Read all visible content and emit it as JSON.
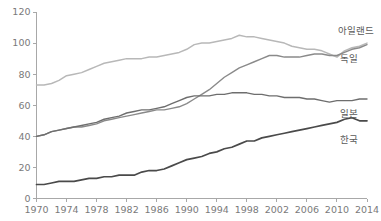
{
  "chart_data": {
    "type": "line",
    "title": "",
    "subtitle": "",
    "xlabel": "",
    "ylabel": "",
    "xlim": [
      1970,
      2014
    ],
    "ylim": [
      0,
      120
    ],
    "grid": false,
    "legend_position": "right-inline-labels",
    "x": [
      1970,
      1971,
      1972,
      1973,
      1974,
      1975,
      1976,
      1977,
      1978,
      1979,
      1980,
      1981,
      1982,
      1983,
      1984,
      1985,
      1986,
      1987,
      1988,
      1989,
      1990,
      1991,
      1992,
      1993,
      1994,
      1995,
      1996,
      1997,
      1998,
      1999,
      2000,
      2001,
      2002,
      2003,
      2004,
      2005,
      2006,
      2007,
      2008,
      2009,
      2010,
      2011,
      2012,
      2013,
      2014
    ],
    "xticks": [
      1970,
      1974,
      1978,
      1982,
      1986,
      1990,
      1994,
      1998,
      2002,
      2006,
      2010,
      2014
    ],
    "yticks": [
      0,
      20,
      40,
      60,
      80,
      100,
      120
    ],
    "series": [
      {
        "name": "아일랜드",
        "color": "#b8b8b8",
        "width": 1.5,
        "values": [
          73,
          73,
          74,
          76,
          79,
          80,
          81,
          83,
          85,
          87,
          88,
          89,
          90,
          90,
          90,
          91,
          91,
          92,
          93,
          94,
          96,
          99,
          100,
          100,
          101,
          102,
          103,
          105,
          104,
          104,
          103,
          102,
          101,
          100,
          98,
          97,
          96,
          96,
          95,
          93,
          91,
          95,
          97,
          98,
          100
        ]
      },
      {
        "name": "독일",
        "color": "#8a8a8a",
        "width": 1.4,
        "values": [
          40,
          41,
          43,
          44,
          45,
          46,
          46,
          47,
          48,
          50,
          51,
          52,
          53,
          54,
          55,
          56,
          57,
          57,
          58,
          59,
          61,
          64,
          67,
          70,
          74,
          78,
          81,
          84,
          86,
          88,
          90,
          92,
          92,
          91,
          91,
          91,
          92,
          93,
          93,
          92,
          92,
          94,
          96,
          97,
          99
        ]
      },
      {
        "name": "일본",
        "color": "#6e6e6e",
        "width": 1.4,
        "values": [
          40,
          41,
          43,
          44,
          45,
          46,
          47,
          48,
          49,
          51,
          52,
          53,
          55,
          56,
          57,
          57,
          58,
          59,
          61,
          63,
          65,
          66,
          66,
          66,
          67,
          67,
          68,
          68,
          68,
          67,
          67,
          66,
          66,
          65,
          65,
          65,
          64,
          64,
          63,
          62,
          63,
          63,
          63,
          64,
          64
        ]
      },
      {
        "name": "한국",
        "color": "#4a4a4a",
        "width": 1.7,
        "values": [
          9,
          9,
          10,
          11,
          11,
          11,
          12,
          13,
          13,
          14,
          14,
          15,
          15,
          15,
          17,
          18,
          18,
          19,
          21,
          23,
          25,
          26,
          27,
          29,
          30,
          32,
          33,
          35,
          37,
          37,
          39,
          40,
          41,
          42,
          43,
          44,
          45,
          46,
          47,
          48,
          49,
          51,
          52,
          50,
          50
        ]
      }
    ],
    "series_labels": [
      {
        "name": "아일랜드",
        "x": 338,
        "y": 34
      },
      {
        "name": "독일",
        "x": 340,
        "y": 62
      },
      {
        "name": "일본",
        "x": 340,
        "y": 117
      },
      {
        "name": "한국",
        "x": 340,
        "y": 143
      }
    ]
  },
  "axis": {
    "y_tick_texts": [
      "120",
      "100",
      "80",
      "60",
      "40",
      "20",
      "0"
    ],
    "x_tick_texts": [
      "1970",
      "1974",
      "1978",
      "1982",
      "1986",
      "1990",
      "1994",
      "1998",
      "2002",
      "2006",
      "2010",
      "2014"
    ]
  },
  "colors": {
    "axis": "#a8a8a8",
    "tick_text": "#7a7a7a",
    "label_text": "#5a5a5a",
    "background": "#ffffff"
  }
}
